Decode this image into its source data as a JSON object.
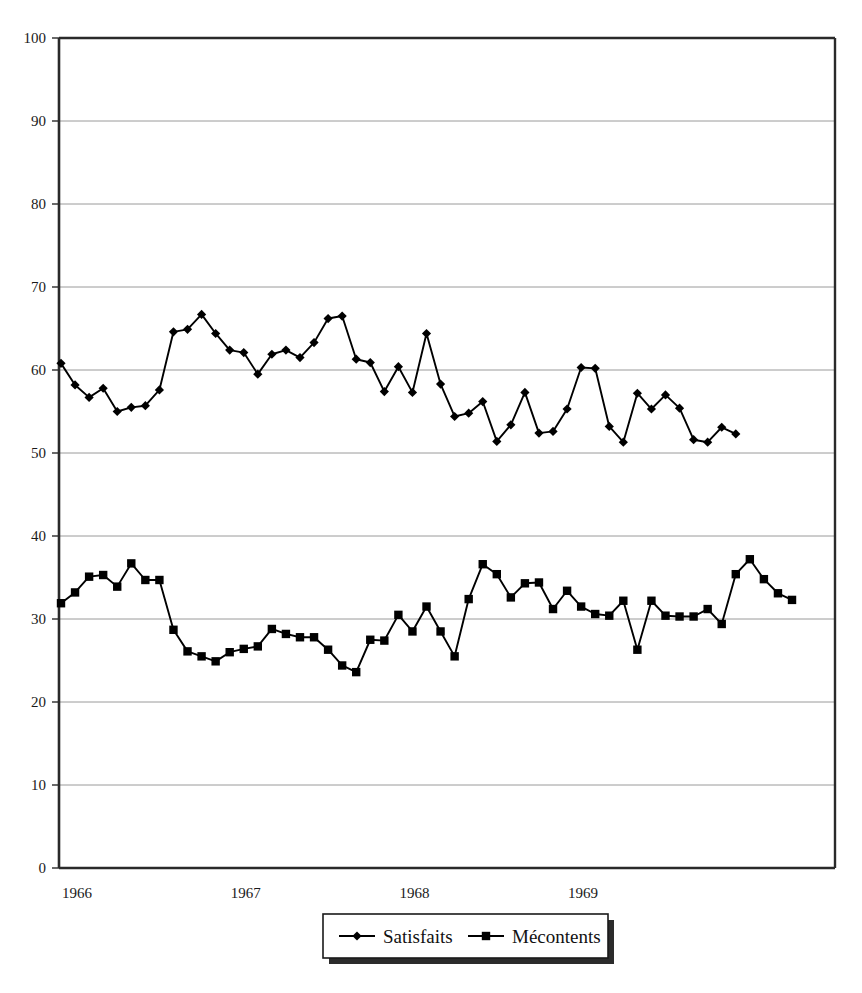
{
  "chart_data": {
    "type": "line",
    "title": "",
    "subtitle": "",
    "xlabel": "",
    "ylabel": "",
    "ylim": [
      0,
      100
    ],
    "yticks": [
      0,
      10,
      20,
      30,
      40,
      50,
      60,
      70,
      80,
      90,
      100
    ],
    "ytick_labels": [
      "0",
      "10",
      "20",
      "30",
      "40",
      "50",
      "60",
      "70",
      "80",
      "90",
      "100"
    ],
    "xtick_labels": [
      "1966",
      "1967",
      "1968",
      "1969"
    ],
    "xtick_positions": [
      0,
      12,
      24,
      36
    ],
    "grid": "horizontal",
    "legend_position": "bottom",
    "x_count": 49,
    "series": [
      {
        "name": "Satisfaits",
        "marker": "diamond",
        "color": "#000000",
        "values": [
          60.8,
          58.2,
          56.7,
          57.8,
          55.0,
          55.5,
          55.7,
          57.6,
          64.6,
          64.9,
          66.7,
          64.4,
          62.4,
          62.1,
          59.5,
          61.9,
          62.4,
          61.5,
          63.3,
          66.2,
          66.5,
          61.3,
          60.9,
          57.4,
          60.4,
          57.3,
          64.4,
          58.3,
          54.4,
          54.8,
          56.2,
          51.4,
          53.4,
          57.3,
          52.4,
          52.6,
          55.3,
          60.3,
          60.2,
          53.2,
          51.3,
          57.2,
          55.3,
          57.0,
          55.4,
          51.6,
          51.3,
          53.1,
          52.3
        ]
      },
      {
        "name": "Mécontents",
        "marker": "square",
        "color": "#000000",
        "values": [
          31.9,
          33.2,
          35.1,
          35.3,
          33.9,
          36.7,
          34.7,
          34.7,
          28.7,
          26.1,
          25.5,
          24.9,
          26.0,
          26.4,
          26.7,
          28.8,
          28.2,
          27.8,
          27.8,
          26.3,
          24.4,
          23.6,
          27.5,
          27.4,
          30.5,
          28.5,
          31.5,
          28.5,
          25.5,
          32.4,
          36.6,
          35.4,
          32.6,
          34.3,
          34.4,
          31.2,
          33.4,
          31.5,
          30.6,
          30.4,
          32.2,
          26.3,
          32.2,
          30.4,
          30.3,
          30.3,
          31.2,
          29.4,
          35.4,
          37.2,
          34.8,
          33.1,
          32.3
        ]
      }
    ]
  },
  "legend": {
    "entries": [
      {
        "label": "Satisfaits",
        "marker": "diamond"
      },
      {
        "label": "Mécontents",
        "marker": "square"
      }
    ]
  }
}
